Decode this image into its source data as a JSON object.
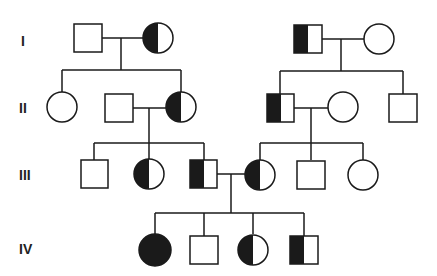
{
  "diagram": {
    "type": "pedigree",
    "colors": {
      "line": "#1a1a1a",
      "fill_affected": "#1a1a1a",
      "fill_unaffected": "#ffffff"
    },
    "generations": [
      {
        "label": "I"
      },
      {
        "label": "II"
      },
      {
        "label": "III"
      },
      {
        "label": "IV"
      }
    ],
    "legend_note": "Squares = male, circles = female; fully filled = affected, half-filled = carrier",
    "individuals": [
      {
        "id": "I-1",
        "sex": "male",
        "status": "unaffected"
      },
      {
        "id": "I-2",
        "sex": "female",
        "status": "carrier"
      },
      {
        "id": "I-3",
        "sex": "male",
        "status": "carrier"
      },
      {
        "id": "I-4",
        "sex": "female",
        "status": "unaffected"
      },
      {
        "id": "II-1",
        "sex": "female",
        "status": "unaffected"
      },
      {
        "id": "II-2",
        "sex": "male",
        "status": "unaffected"
      },
      {
        "id": "II-3",
        "sex": "female",
        "status": "carrier"
      },
      {
        "id": "II-4",
        "sex": "male",
        "status": "carrier"
      },
      {
        "id": "II-5",
        "sex": "female",
        "status": "unaffected"
      },
      {
        "id": "II-6",
        "sex": "male",
        "status": "unaffected"
      },
      {
        "id": "III-1",
        "sex": "male",
        "status": "unaffected"
      },
      {
        "id": "III-2",
        "sex": "female",
        "status": "carrier"
      },
      {
        "id": "III-3",
        "sex": "male",
        "status": "carrier"
      },
      {
        "id": "III-4",
        "sex": "female",
        "status": "carrier"
      },
      {
        "id": "III-5",
        "sex": "male",
        "status": "unaffected"
      },
      {
        "id": "III-6",
        "sex": "female",
        "status": "unaffected"
      },
      {
        "id": "IV-1",
        "sex": "female",
        "status": "affected"
      },
      {
        "id": "IV-2",
        "sex": "male",
        "status": "unaffected"
      },
      {
        "id": "IV-3",
        "sex": "female",
        "status": "carrier"
      },
      {
        "id": "IV-4",
        "sex": "male",
        "status": "carrier"
      }
    ]
  }
}
